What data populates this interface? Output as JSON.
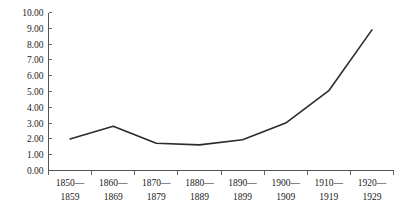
{
  "chart_data": {
    "type": "line",
    "title": "",
    "subtitle": "",
    "xlabel": "",
    "ylabel": "",
    "categories": [
      "1850—\n1859",
      "1860—\n1869",
      "1870—\n1879",
      "1880—\n1889",
      "1890—\n1899",
      "1900—\n1909",
      "1910—\n1919",
      "1920—\n1929"
    ],
    "categories_line1": [
      "1850—",
      "1860—",
      "1870—",
      "1880—",
      "1890—",
      "1900—",
      "1910—",
      "1920—"
    ],
    "categories_line2": [
      "1859",
      "1869",
      "1879",
      "1889",
      "1899",
      "1909",
      "1919",
      "1929"
    ],
    "values": [
      2.0,
      2.8,
      1.72,
      1.62,
      1.95,
      3.0,
      5.05,
      8.9
    ],
    "ylim": [
      0,
      10
    ],
    "ytick_values": [
      0,
      1,
      2,
      3,
      4,
      5,
      6,
      7,
      8,
      9,
      10
    ],
    "ytick_labels": [
      "0.00",
      "1.00",
      "2.00",
      "3.00",
      "4.00",
      "5.00",
      "6.00",
      "7.00",
      "8.00",
      "9.00",
      "10.00"
    ],
    "grid": false,
    "legend": null,
    "legend_position": "none",
    "series": [
      {
        "name": "",
        "values": [
          2.0,
          2.8,
          1.72,
          1.62,
          1.95,
          3.0,
          5.05,
          8.9
        ],
        "color": "#2b2b2b"
      }
    ],
    "annotations": []
  },
  "colors": {
    "background": "#ffffff",
    "line": "#2b2b2b",
    "axis": "#555555",
    "tick": "#666666",
    "text": "#1a1a1a"
  }
}
